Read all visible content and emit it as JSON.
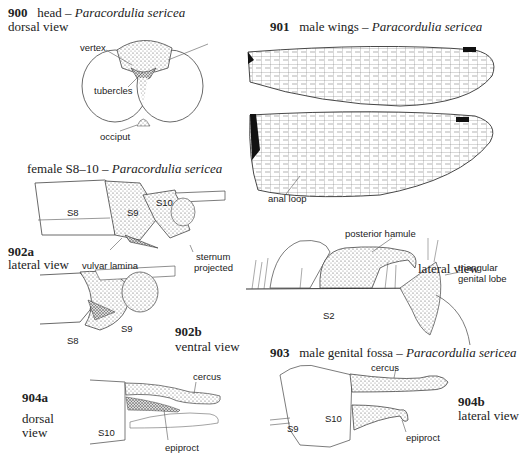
{
  "figures": {
    "f900": {
      "number": "900",
      "title": "head – ",
      "species": "Paracordulia sericea",
      "view": "dorsal view",
      "labels": {
        "vertex": "vertex",
        "tubercles": "tubercles",
        "occiput": "occiput"
      }
    },
    "f901": {
      "number": "901",
      "title": "male wings – ",
      "species": "Paracordulia sericea",
      "labels": {
        "anal_loop": "anal loop"
      }
    },
    "f902": {
      "title": "female S8–10 – ",
      "species": "Paracordulia sericea",
      "a": {
        "number": "902a",
        "view": "lateral view"
      },
      "b": {
        "number": "902b",
        "view": "ventral view"
      },
      "labels": {
        "s8": "S8",
        "s9": "S9",
        "s10": "S10",
        "sternum_1": "sternum",
        "sternum_2": "projected",
        "vulvar_lamina": "vulvar lamina",
        "s8b": "S8",
        "s9b": "S9"
      }
    },
    "f903": {
      "number": "903",
      "title": "male genital fossa – ",
      "species": "Paracordulia sericea",
      "view": "lateral view",
      "labels": {
        "posterior_hamule": "posterior hamule",
        "tri_1": "triangular",
        "tri_2": "genital lobe",
        "s2": "S2"
      }
    },
    "f904a": {
      "number": "904a",
      "view_1": "dorsal",
      "view_2": "view",
      "labels": {
        "cercus": "cercus",
        "epiproct": "epiproct",
        "s10": "S10"
      }
    },
    "f904b": {
      "number": "904b",
      "view": "lateral view",
      "labels": {
        "cercus": "cercus",
        "epiproct": "epiproct",
        "s10": "S10",
        "s9": "S9"
      }
    }
  }
}
